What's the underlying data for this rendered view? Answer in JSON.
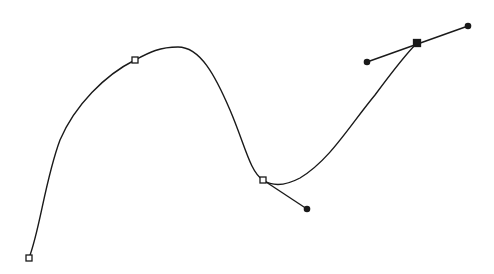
{
  "diagram": {
    "type": "bezier-spline",
    "background": "#ffffff",
    "stroke_color": "#1a1a1a",
    "curve_path": "M29,258 C40,230 45,180 60,140 C75,105 105,75 135,60 C150,52 160,47 178,47 C200,47 215,75 230,110 C245,145 250,172 263,180 C272,186 285,186 300,178 C330,160 350,125 375,95 C392,72 405,55 417,43",
    "anchors": [
      {
        "x": 29,
        "y": 258,
        "style": "open-square"
      },
      {
        "x": 135,
        "y": 60,
        "style": "open-square"
      },
      {
        "x": 263,
        "y": 180,
        "style": "open-square"
      },
      {
        "x": 417,
        "y": 43,
        "style": "filled-square"
      }
    ],
    "handles": [
      {
        "from": {
          "x": 263,
          "y": 180
        },
        "to": {
          "x": 307,
          "y": 209
        }
      },
      {
        "from": {
          "x": 367,
          "y": 62
        },
        "to": {
          "x": 468,
          "y": 26
        }
      }
    ],
    "handle_points": [
      {
        "x": 307,
        "y": 209
      },
      {
        "x": 367,
        "y": 62
      },
      {
        "x": 468,
        "y": 26
      }
    ]
  }
}
